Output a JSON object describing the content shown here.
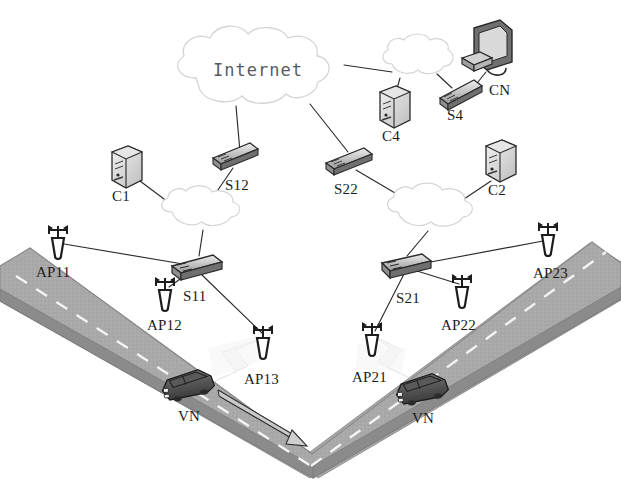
{
  "figure": {
    "type": "network-topology-diagram"
  },
  "clouds": [
    {
      "id": "internet",
      "label": "Internet",
      "cx": 260,
      "cy": 71,
      "rx": 86,
      "ry": 39
    },
    {
      "id": "cloud-left",
      "label": "",
      "cx": 205,
      "cy": 214,
      "rx": 45,
      "ry": 20
    },
    {
      "id": "cloud-right",
      "label": "",
      "cx": 435,
      "cy": 213,
      "rx": 50,
      "ry": 21
    },
    {
      "id": "cloud-top-right",
      "label": "",
      "cx": 418,
      "cy": 64,
      "rx": 38,
      "ry": 18
    }
  ],
  "nodes": [
    {
      "id": "C1",
      "label": "C1",
      "kind": "server",
      "x": 126,
      "y": 172,
      "label_x": 112,
      "label_y": 188
    },
    {
      "id": "C4",
      "label": "C4",
      "kind": "server",
      "x": 394,
      "y": 112,
      "label_x": 382,
      "label_y": 128
    },
    {
      "id": "C2",
      "label": "C2",
      "kind": "server",
      "x": 500,
      "y": 166,
      "label_x": 488,
      "label_y": 182
    },
    {
      "id": "CN",
      "label": "CN",
      "kind": "monitor",
      "x": 489,
      "y": 52,
      "label_x": 489,
      "label_y": 82
    },
    {
      "id": "S4",
      "label": "S4",
      "kind": "switch",
      "x": 462,
      "y": 92,
      "label_x": 447,
      "label_y": 107
    },
    {
      "id": "S12",
      "label": "S12",
      "kind": "switch",
      "x": 237,
      "y": 159,
      "label_x": 225,
      "label_y": 177
    },
    {
      "id": "S22",
      "label": "S22",
      "kind": "switch",
      "x": 348,
      "y": 160,
      "label_x": 334,
      "label_y": 181
    },
    {
      "id": "S11",
      "label": "S11",
      "kind": "switch",
      "x": 197,
      "y": 265,
      "label_x": 183,
      "label_y": 288
    },
    {
      "id": "S21",
      "label": "S21",
      "kind": "switch",
      "x": 406,
      "y": 264,
      "label_x": 396,
      "label_y": 290
    },
    {
      "id": "AP11",
      "label": "AP11",
      "kind": "antenna",
      "x": 58,
      "y": 238,
      "label_x": 36,
      "label_y": 264
    },
    {
      "id": "AP12",
      "label": "AP12",
      "kind": "antenna",
      "x": 165,
      "y": 290,
      "label_x": 147,
      "label_y": 317
    },
    {
      "id": "AP13",
      "label": "AP13",
      "kind": "antenna",
      "x": 263,
      "y": 338,
      "label_x": 244,
      "label_y": 371
    },
    {
      "id": "AP21",
      "label": "AP21",
      "kind": "antenna",
      "x": 372,
      "y": 335,
      "label_x": 352,
      "label_y": 369
    },
    {
      "id": "AP22",
      "label": "AP22",
      "kind": "antenna",
      "x": 462,
      "y": 287,
      "label_x": 441,
      "label_y": 317
    },
    {
      "id": "AP23",
      "label": "AP23",
      "kind": "antenna",
      "x": 548,
      "y": 235,
      "label_x": 533,
      "label_y": 265
    },
    {
      "id": "VN1",
      "label": "VN",
      "kind": "vehicle",
      "x": 190,
      "y": 385,
      "label_x": 178,
      "label_y": 408
    },
    {
      "id": "VN2",
      "label": "VN",
      "kind": "vehicle",
      "x": 424,
      "y": 389,
      "label_x": 412,
      "label_y": 410
    }
  ],
  "links": [
    {
      "from": "internet",
      "to": "cloud-top-right"
    },
    {
      "from": "internet",
      "to": "S12"
    },
    {
      "from": "internet",
      "to": "S22"
    },
    {
      "from": "cloud-top-right",
      "to": "C4"
    },
    {
      "from": "cloud-top-right",
      "to": "S4"
    },
    {
      "from": "S4",
      "to": "CN"
    },
    {
      "from": "S12",
      "to": "cloud-left"
    },
    {
      "from": "C1",
      "to": "cloud-left"
    },
    {
      "from": "cloud-left",
      "to": "S11"
    },
    {
      "from": "S22",
      "to": "cloud-right"
    },
    {
      "from": "C2",
      "to": "cloud-right"
    },
    {
      "from": "cloud-right",
      "to": "S21"
    },
    {
      "from": "S11",
      "to": "AP11"
    },
    {
      "from": "S11",
      "to": "AP12"
    },
    {
      "from": "S11",
      "to": "AP13"
    },
    {
      "from": "S21",
      "to": "AP21"
    },
    {
      "from": "S21",
      "to": "AP22"
    },
    {
      "from": "S21",
      "to": "AP23"
    }
  ],
  "road": {
    "shape": "v-shaped-highway",
    "surface_color": "#a8a8a8",
    "lane_marking": "dashed-white-centerline",
    "direction_arrow": "points down-right toward the bend"
  },
  "colors": {
    "line": "#2b2b2b",
    "road": "#a9a9a9",
    "road_edge": "#8c8c8c",
    "cloud_stroke": "#cfcfcf",
    "device_dark": "#3a3a3a",
    "device_light": "#e8e8e8",
    "text": "#1c1c1c"
  }
}
